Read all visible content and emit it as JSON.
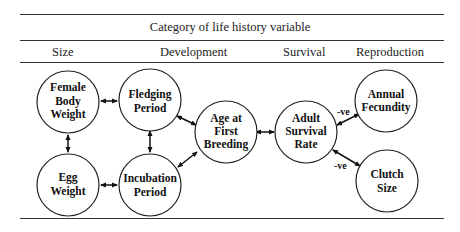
{
  "table": {
    "title": "Category of life history variable",
    "columns": [
      "Size",
      "Development",
      "Survival",
      "Reproduction"
    ]
  },
  "nodes": [
    {
      "id": "female_body_weight",
      "lines": [
        "Female",
        "Body",
        "Weight"
      ],
      "category": "Size"
    },
    {
      "id": "egg_weight",
      "lines": [
        "Egg",
        "Weight"
      ],
      "category": "Size"
    },
    {
      "id": "fledging_period",
      "lines": [
        "Fledging",
        "Period"
      ],
      "category": "Development"
    },
    {
      "id": "incubation_period",
      "lines": [
        "Incubation",
        "Period"
      ],
      "category": "Development"
    },
    {
      "id": "age_first_breeding",
      "lines": [
        "Age at",
        "First",
        "Breeding"
      ],
      "category": "Development"
    },
    {
      "id": "adult_survival_rate",
      "lines": [
        "Adult",
        "Survival",
        "Rate"
      ],
      "category": "Survival"
    },
    {
      "id": "annual_fecundity",
      "lines": [
        "Annual",
        "Fecundity"
      ],
      "category": "Reproduction"
    },
    {
      "id": "clutch_size",
      "lines": [
        "Clutch",
        "Size"
      ],
      "category": "Reproduction"
    }
  ],
  "edges": [
    {
      "from": "female_body_weight",
      "to": "fledging_period",
      "label": ""
    },
    {
      "from": "female_body_weight",
      "to": "egg_weight",
      "label": ""
    },
    {
      "from": "fledging_period",
      "to": "incubation_period",
      "label": ""
    },
    {
      "from": "egg_weight",
      "to": "incubation_period",
      "label": ""
    },
    {
      "from": "fledging_period",
      "to": "age_first_breeding",
      "label": ""
    },
    {
      "from": "incubation_period",
      "to": "age_first_breeding",
      "label": ""
    },
    {
      "from": "age_first_breeding",
      "to": "adult_survival_rate",
      "label": ""
    },
    {
      "from": "adult_survival_rate",
      "to": "annual_fecundity",
      "label": "-ve"
    },
    {
      "from": "adult_survival_rate",
      "to": "clutch_size",
      "label": "-ve"
    }
  ]
}
